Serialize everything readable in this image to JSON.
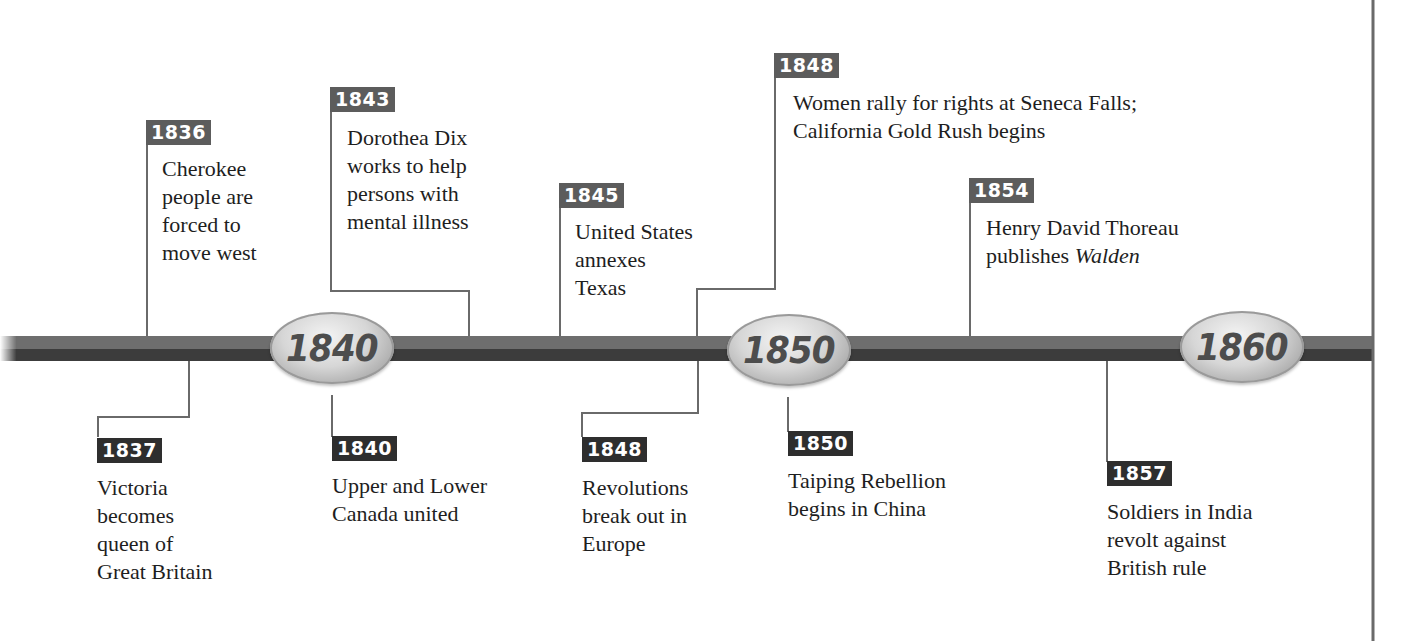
{
  "timeline": {
    "colors": {
      "bar_top": "#6e6e6e",
      "bar_bottom": "#3c3c3c",
      "connector": "#6a6a6a",
      "badge_top": "#5c5c5c",
      "badge_bottom": "#2e2e2e",
      "decade_text": "#4d4d4d"
    },
    "decades": [
      {
        "label": "1840"
      },
      {
        "label": "1850"
      },
      {
        "label": "1860"
      }
    ],
    "events_above": [
      {
        "year": "1836",
        "text": "Cherokee\npeople are\nforced to\nmove west"
      },
      {
        "year": "1843",
        "text": "Dorothea Dix\nworks to help\npersons with\nmental illness"
      },
      {
        "year": "1845",
        "text": "United States\nannexes\nTexas"
      },
      {
        "year": "1848",
        "text": "Women rally for rights at Seneca Falls;\nCalifornia Gold Rush begins"
      },
      {
        "year": "1854",
        "text_main": "Henry David Thoreau\npublishes ",
        "text_italic": "Walden"
      }
    ],
    "events_below": [
      {
        "year": "1837",
        "text": "Victoria\nbecomes\nqueen of\nGreat Britain"
      },
      {
        "year": "1840",
        "text": "Upper and Lower\nCanada united"
      },
      {
        "year": "1848",
        "text": "Revolutions\nbreak out in\nEurope"
      },
      {
        "year": "1850",
        "text": "Taiping Rebellion\nbegins in China"
      },
      {
        "year": "1857",
        "text": "Soldiers in India\nrevolt against\nBritish rule"
      }
    ]
  }
}
